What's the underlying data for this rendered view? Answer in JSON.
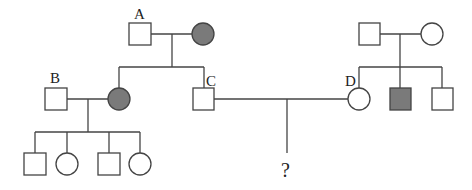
{
  "diagram": {
    "type": "pedigree",
    "colors": {
      "line": "#444444",
      "affected_fill": "#7a7a7a",
      "unaffected_fill": "#ffffff"
    },
    "labels": {
      "A": "A",
      "B": "B",
      "C": "C",
      "D": "D",
      "unknown": "?"
    },
    "individuals": [
      {
        "id": "A",
        "sex": "male",
        "affected": false,
        "generation": 1
      },
      {
        "id": "A-spouse",
        "sex": "female",
        "affected": true,
        "generation": 1
      },
      {
        "id": "B",
        "sex": "male",
        "affected": false,
        "generation": 2
      },
      {
        "id": "B-spouse",
        "sex": "female",
        "affected": true,
        "generation": 2
      },
      {
        "id": "C",
        "sex": "male",
        "affected": false,
        "generation": 2
      },
      {
        "id": "D",
        "sex": "female",
        "affected": false,
        "generation": 2
      },
      {
        "id": "D-father",
        "sex": "male",
        "affected": false,
        "generation": 1
      },
      {
        "id": "D-mother",
        "sex": "female",
        "affected": false,
        "generation": 1
      },
      {
        "id": "D-brother-1",
        "sex": "male",
        "affected": true,
        "generation": 2
      },
      {
        "id": "D-brother-2",
        "sex": "male",
        "affected": false,
        "generation": 2
      },
      {
        "id": "B-child-1",
        "sex": "male",
        "affected": false,
        "generation": 3
      },
      {
        "id": "B-child-2",
        "sex": "female",
        "affected": false,
        "generation": 3
      },
      {
        "id": "B-child-3",
        "sex": "male",
        "affected": false,
        "generation": 3
      },
      {
        "id": "B-child-4",
        "sex": "female",
        "affected": false,
        "generation": 3
      },
      {
        "id": "CD-child",
        "sex": "unknown",
        "affected": null,
        "generation": 3
      }
    ]
  }
}
